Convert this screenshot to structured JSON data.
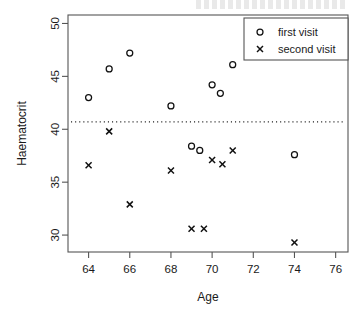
{
  "chart_data": {
    "type": "scatter",
    "title": "",
    "xlabel": "Age",
    "ylabel": "Haematocrit",
    "xlim": [
      63.0,
      76.6
    ],
    "ylim": [
      28.4,
      50.8
    ],
    "xticks": [
      64,
      66,
      68,
      70,
      72,
      74,
      76
    ],
    "yticks": [
      30,
      35,
      40,
      45,
      50
    ],
    "grid": false,
    "legend_position": "top-right",
    "reference_line": {
      "orientation": "horizontal",
      "value": 40.7,
      "style": "dotted"
    },
    "series": [
      {
        "name": "first visit",
        "marker": "circle",
        "points": [
          {
            "x": 64.0,
            "y": 43.0
          },
          {
            "x": 65.0,
            "y": 45.7
          },
          {
            "x": 66.0,
            "y": 47.2
          },
          {
            "x": 68.0,
            "y": 42.2
          },
          {
            "x": 69.0,
            "y": 38.4
          },
          {
            "x": 69.4,
            "y": 38.0
          },
          {
            "x": 70.0,
            "y": 44.2
          },
          {
            "x": 70.4,
            "y": 43.4
          },
          {
            "x": 71.0,
            "y": 46.1
          },
          {
            "x": 74.0,
            "y": 37.6
          }
        ]
      },
      {
        "name": "second visit",
        "marker": "x",
        "points": [
          {
            "x": 64.0,
            "y": 36.6
          },
          {
            "x": 65.0,
            "y": 39.8
          },
          {
            "x": 66.0,
            "y": 32.9
          },
          {
            "x": 68.0,
            "y": 36.1
          },
          {
            "x": 69.0,
            "y": 30.6
          },
          {
            "x": 69.6,
            "y": 30.6
          },
          {
            "x": 70.0,
            "y": 37.1
          },
          {
            "x": 70.5,
            "y": 36.7
          },
          {
            "x": 71.0,
            "y": 38.0
          },
          {
            "x": 74.0,
            "y": 29.3
          }
        ]
      }
    ]
  },
  "axes": {
    "x_title": "Age",
    "y_title": "Haematocrit",
    "x_tick_labels": [
      "64",
      "66",
      "68",
      "70",
      "72",
      "74",
      "76"
    ],
    "y_tick_labels": [
      "30",
      "35",
      "40",
      "45",
      "50"
    ]
  },
  "legend": {
    "entries": [
      {
        "label": "first visit",
        "marker": "circle-marker"
      },
      {
        "label": "second visit",
        "marker": "cross-marker"
      }
    ]
  },
  "colors": {
    "marker": "#111111",
    "frame": "#555555",
    "reference_line": "#222222",
    "background": "#ffffff"
  }
}
